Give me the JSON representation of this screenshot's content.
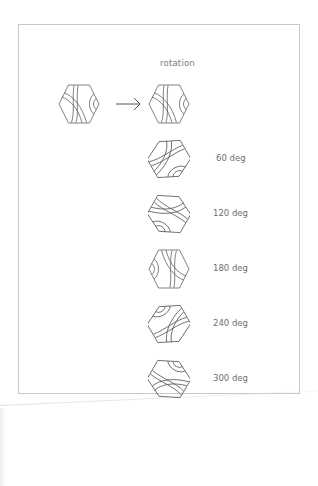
{
  "diagram": {
    "title": "rotation",
    "source_tile": {
      "rotation_deg": 0
    },
    "arrow": {
      "icon": "right-arrow-icon"
    },
    "rotations": [
      {
        "rotation_deg": 0,
        "label": ""
      },
      {
        "rotation_deg": 60,
        "label": "60 deg"
      },
      {
        "rotation_deg": 120,
        "label": "120 deg"
      },
      {
        "rotation_deg": 180,
        "label": "180 deg"
      },
      {
        "rotation_deg": 240,
        "label": "240 deg"
      },
      {
        "rotation_deg": 300,
        "label": "300 deg"
      }
    ],
    "colors": {
      "stroke": "#555555",
      "frame": "#c8c8c8",
      "text": "#6e6e6e"
    }
  }
}
